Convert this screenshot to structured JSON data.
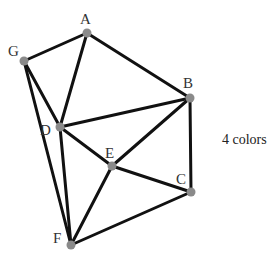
{
  "caption": "4 colors",
  "colors": {
    "edge": "#111111",
    "node": "#8a8a8a",
    "label": "#333333"
  },
  "nodes": [
    {
      "id": "A",
      "label": "A",
      "x": 87,
      "y": 33,
      "lx": 80,
      "ly": 24
    },
    {
      "id": "G",
      "label": "G",
      "x": 24,
      "y": 61,
      "lx": 8,
      "ly": 56
    },
    {
      "id": "B",
      "label": "B",
      "x": 190,
      "y": 98,
      "lx": 183,
      "ly": 88
    },
    {
      "id": "D",
      "label": "D",
      "x": 60,
      "y": 127,
      "lx": 40,
      "ly": 135
    },
    {
      "id": "E",
      "label": "E",
      "x": 112,
      "y": 166,
      "lx": 105,
      "ly": 158
    },
    {
      "id": "C",
      "label": "C",
      "x": 191,
      "y": 192,
      "lx": 176,
      "ly": 184
    },
    {
      "id": "F",
      "label": "F",
      "x": 71,
      "y": 245,
      "lx": 53,
      "ly": 243
    }
  ],
  "edges": [
    [
      "A",
      "G"
    ],
    [
      "A",
      "B"
    ],
    [
      "A",
      "D"
    ],
    [
      "G",
      "D"
    ],
    [
      "G",
      "F"
    ],
    [
      "D",
      "B"
    ],
    [
      "D",
      "E"
    ],
    [
      "D",
      "F"
    ],
    [
      "B",
      "E"
    ],
    [
      "B",
      "C"
    ],
    [
      "E",
      "C"
    ],
    [
      "E",
      "F"
    ],
    [
      "F",
      "C"
    ]
  ]
}
